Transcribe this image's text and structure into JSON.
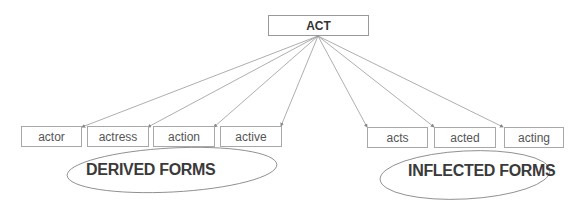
{
  "root": {
    "label": "ACT"
  },
  "derived": {
    "items": [
      {
        "label": "actor"
      },
      {
        "label": "actress"
      },
      {
        "label": "action"
      },
      {
        "label": "active"
      }
    ],
    "group_label": "DERIVED FORMS"
  },
  "inflected": {
    "items": [
      {
        "label": "acts"
      },
      {
        "label": "acted"
      },
      {
        "label": "acting"
      }
    ],
    "group_label": "INFLECTED FORMS"
  }
}
